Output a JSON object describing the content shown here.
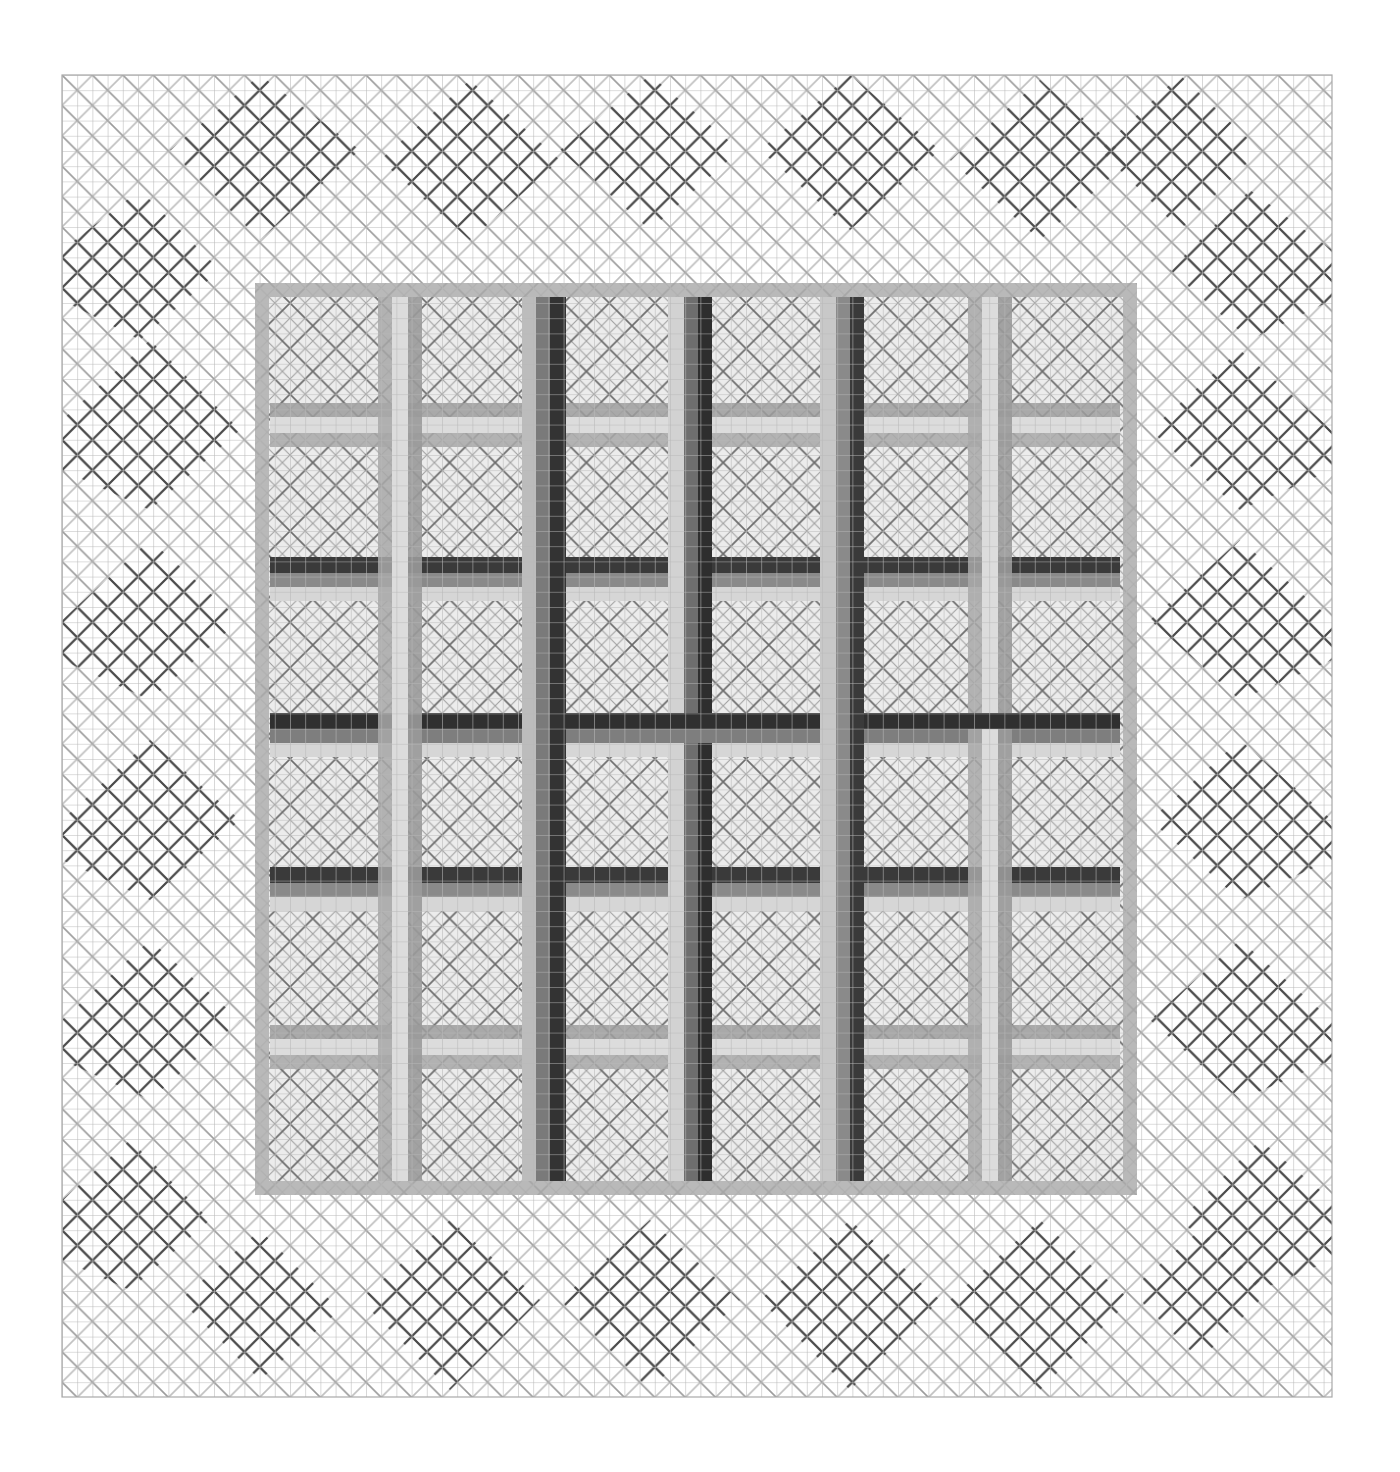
{
  "artwork": {
    "title": "",
    "medium": "graphite on graph paper",
    "description": "Woven lattice pattern: square grid of graph paper with a diagonal crosshatch border of stepped diamond motifs surrounding a central square of interlaced horizontal and vertical tri-tone bands over fine diagonal lattice.",
    "colors": {
      "paper": "#ffffff",
      "grid_line": "#b4b4b4",
      "diag_light": "#a8a8a8",
      "diag_dark": "#555555",
      "band_light": "#d9d9d9",
      "band_mid": "#9a9a9a",
      "band_dark": "#3a3a3a",
      "inner_fill": "#e6e6e6"
    },
    "layout": {
      "grid_bounds": {
        "x": 62,
        "y": 75,
        "w": 1270,
        "h": 1322
      },
      "cell": 15.2,
      "inner_square": {
        "x": 255,
        "y": 283,
        "w": 882,
        "h": 912
      },
      "vertical_bands_x": [
        395,
        550,
        697,
        855,
        990
      ],
      "horizontal_bands_y": [
        420,
        570,
        725,
        880,
        1040
      ]
    }
  }
}
